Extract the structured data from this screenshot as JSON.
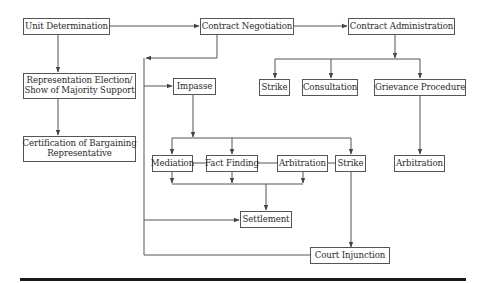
{
  "diagram": {
    "type": "flowchart",
    "title": "",
    "colors": {
      "line": "#555555",
      "text": "#2b2b2b",
      "rule": "#1a1a1a",
      "background": "#ffffff"
    },
    "nodes": {
      "unit_determination": {
        "label": "Unit Determination"
      },
      "contract_negotiation": {
        "label": "Contract Negotiation"
      },
      "contract_administration": {
        "label": "Contract Administration"
      },
      "representation_election": {
        "line1": "Representation Election/",
        "line2": "Show of Majority Support"
      },
      "certification": {
        "line1": "Certification of Bargaining",
        "line2": "Representative"
      },
      "impasse": {
        "label": "Impasse"
      },
      "strike_admin": {
        "label": "Strike"
      },
      "consultation": {
        "label": "Consultation"
      },
      "grievance_procedure": {
        "label": "Grievance Procedure"
      },
      "mediation": {
        "label": "Mediation"
      },
      "fact_finding": {
        "label": "Fact Finding"
      },
      "arbitration_impasse": {
        "label": "Arbitration"
      },
      "strike_impasse": {
        "label": "Strike"
      },
      "arbitration_grievance": {
        "label": "Arbitration"
      },
      "settlement": {
        "label": "Settlement"
      },
      "court_injunction": {
        "label": "Court Injunction"
      }
    },
    "edges": [
      {
        "from": "Unit Determination",
        "to": "Contract Negotiation"
      },
      {
        "from": "Contract Negotiation",
        "to": "Contract Administration"
      },
      {
        "from": "Unit Determination",
        "to": "Representation Election/Show of Majority Support"
      },
      {
        "from": "Representation Election/Show of Majority Support",
        "to": "Certification of Bargaining Representative"
      },
      {
        "from": "Contract Negotiation",
        "to": "Impasse"
      },
      {
        "from": "Contract Negotiation",
        "to": "Settlement"
      },
      {
        "from": "Contract Administration",
        "to": "Strike"
      },
      {
        "from": "Contract Administration",
        "to": "Consultation"
      },
      {
        "from": "Contract Administration",
        "to": "Grievance Procedure"
      },
      {
        "from": "Grievance Procedure",
        "to": "Arbitration"
      },
      {
        "from": "Impasse",
        "to": "Mediation"
      },
      {
        "from": "Impasse",
        "to": "Fact Finding"
      },
      {
        "from": "Impasse",
        "to": "Strike"
      },
      {
        "from": "Mediation",
        "to": "Settlement"
      },
      {
        "from": "Fact Finding",
        "to": "Settlement"
      },
      {
        "from": "Arbitration",
        "to": "Settlement"
      },
      {
        "from": "Strike",
        "to": "Court Injunction"
      },
      {
        "from": "Court Injunction",
        "to": "Contract Negotiation"
      }
    ]
  }
}
